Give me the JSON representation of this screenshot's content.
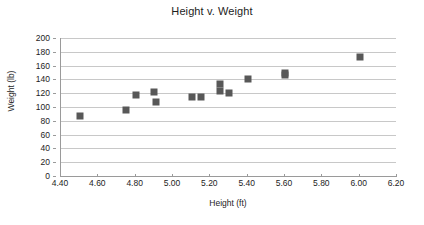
{
  "chart_data": {
    "type": "scatter",
    "title": "Height v. Weight",
    "xlabel": "Height (ft)",
    "ylabel": "Weight (lb)",
    "xlim": [
      4.4,
      6.2
    ],
    "ylim": [
      0,
      200
    ],
    "xticks": [
      "4.40",
      "4.60",
      "4.80",
      "5.00",
      "5.20",
      "5.40",
      "5.60",
      "5.80",
      "6.00",
      "6.20"
    ],
    "xtick_values": [
      4.4,
      4.6,
      4.8,
      5.0,
      5.2,
      5.4,
      5.6,
      5.8,
      6.0,
      6.2
    ],
    "yticks": [
      "200",
      "180",
      "160",
      "140",
      "120",
      "100",
      "80",
      "60",
      "40",
      "20",
      "0"
    ],
    "ytick_values": [
      200,
      180,
      160,
      140,
      120,
      100,
      80,
      60,
      40,
      20,
      0
    ],
    "grid": "horizontal",
    "legend": "none",
    "marker": "square",
    "marker_color": "#585858",
    "series": [
      {
        "name": "Height v. Weight",
        "points": [
          {
            "x": 4.5,
            "y": 87
          },
          {
            "x": 4.75,
            "y": 96
          },
          {
            "x": 4.8,
            "y": 118
          },
          {
            "x": 4.9,
            "y": 122
          },
          {
            "x": 4.91,
            "y": 107
          },
          {
            "x": 5.1,
            "y": 114
          },
          {
            "x": 5.15,
            "y": 114
          },
          {
            "x": 5.25,
            "y": 134
          },
          {
            "x": 5.25,
            "y": 123
          },
          {
            "x": 5.3,
            "y": 120
          },
          {
            "x": 5.4,
            "y": 141
          },
          {
            "x": 5.6,
            "y": 150
          },
          {
            "x": 5.6,
            "y": 147
          },
          {
            "x": 6.0,
            "y": 173
          }
        ]
      }
    ]
  }
}
